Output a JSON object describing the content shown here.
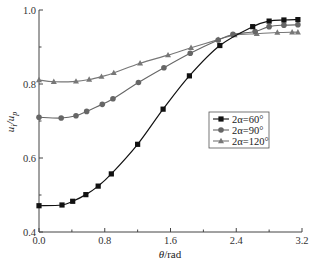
{
  "chart_data": {
    "type": "line",
    "title": "",
    "xlabel": "θ/rad",
    "ylabel": "u_i/u_p",
    "xlim": [
      0.0,
      3.2
    ],
    "ylim": [
      0.4,
      1.0
    ],
    "grid": false,
    "legend_position": "center-right",
    "x_ticks": [
      "0.0",
      "0.8",
      "1.6",
      "2.4",
      "3.2"
    ],
    "y_ticks": [
      "0.4",
      "0.6",
      "0.8",
      "1.0"
    ],
    "series": [
      {
        "name": "2α=60°",
        "marker": "square",
        "color": "#111111",
        "x": [
          0.0,
          0.28,
          0.41,
          0.57,
          0.72,
          0.88,
          1.2,
          1.51,
          1.83,
          2.2,
          2.6,
          2.8,
          2.98,
          3.15
        ],
        "values": [
          0.471,
          0.473,
          0.483,
          0.501,
          0.524,
          0.557,
          0.637,
          0.732,
          0.822,
          0.904,
          0.955,
          0.97,
          0.973,
          0.974
        ]
      },
      {
        "name": "2α=90°",
        "marker": "circle",
        "color": "#666666",
        "x": [
          0.0,
          0.27,
          0.45,
          0.58,
          0.77,
          0.9,
          1.21,
          1.52,
          1.84,
          2.18,
          2.36,
          2.63,
          2.8,
          2.98,
          3.15
        ],
        "values": [
          0.71,
          0.708,
          0.714,
          0.726,
          0.745,
          0.76,
          0.804,
          0.844,
          0.883,
          0.919,
          0.934,
          0.942,
          0.955,
          0.959,
          0.96
        ]
      },
      {
        "name": "2α=120°",
        "marker": "triangle",
        "color": "#777777",
        "x": [
          0.0,
          0.18,
          0.45,
          0.61,
          0.76,
          0.91,
          1.23,
          1.57,
          1.85,
          2.18,
          2.38,
          2.65,
          2.9,
          3.08,
          3.15
        ],
        "values": [
          0.811,
          0.806,
          0.807,
          0.812,
          0.82,
          0.83,
          0.856,
          0.878,
          0.898,
          0.92,
          0.932,
          0.936,
          0.939,
          0.94,
          0.94
        ]
      }
    ]
  },
  "legend": {
    "items": [
      "2α=60°",
      "2α=90°",
      "2α=120°"
    ]
  },
  "axes": {
    "xlabel_italic": "θ",
    "xlabel_rest": "/rad",
    "ylabel_main": "u",
    "ylabel_sub1": "i",
    "ylabel_slash": "/u",
    "ylabel_sub2": "p"
  }
}
